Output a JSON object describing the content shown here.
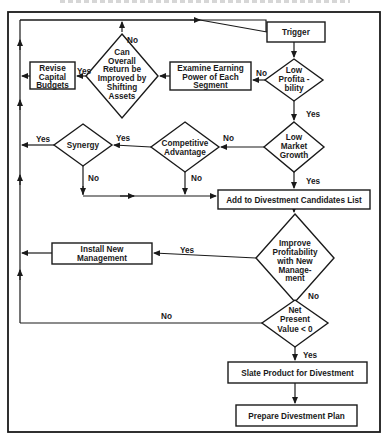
{
  "diagram": {
    "type": "flowchart",
    "nodes": {
      "trigger": {
        "kind": "process",
        "lines": [
          "Trigger"
        ]
      },
      "low_profitability": {
        "kind": "decision",
        "lines": [
          "Low",
          "Profita -",
          "bility"
        ]
      },
      "examine_earning_power": {
        "kind": "process",
        "lines": [
          "Examine Earning",
          "Power of Each",
          "Segment"
        ]
      },
      "can_overall_return": {
        "kind": "decision",
        "lines": [
          "Can",
          "Overall",
          "Return be",
          "Improved by",
          "Shifting",
          "Assets"
        ]
      },
      "revise_capital_budgets": {
        "kind": "process",
        "lines": [
          "Revise",
          "Capital",
          "Budgets"
        ]
      },
      "low_market_growth": {
        "kind": "decision",
        "lines": [
          "Low",
          "Market",
          "Growth"
        ]
      },
      "competitive_advantage": {
        "kind": "decision",
        "lines": [
          "Competitive",
          "Advantage"
        ]
      },
      "synergy": {
        "kind": "decision",
        "lines": [
          "Synergy"
        ]
      },
      "add_to_candidates": {
        "kind": "process",
        "lines": [
          "Add to Divestment Candidates List"
        ]
      },
      "improve_profitability": {
        "kind": "decision",
        "lines": [
          "Improve",
          "Profitability",
          "with New",
          "Manage-",
          "ment"
        ]
      },
      "install_new_management": {
        "kind": "process",
        "lines": [
          "Install New",
          "Management"
        ]
      },
      "net_present_value": {
        "kind": "decision",
        "lines": [
          "Net",
          "Present",
          "Value < 0"
        ]
      },
      "slate_product": {
        "kind": "process",
        "lines": [
          "Slate Product for Divestment"
        ]
      },
      "prepare_plan": {
        "kind": "process",
        "lines": [
          "Prepare Divestment Plan"
        ]
      }
    },
    "edges": [
      {
        "from": "trigger",
        "to": "low_profitability",
        "label": ""
      },
      {
        "from": "low_profitability",
        "to": "examine_earning_power",
        "label": "No"
      },
      {
        "from": "low_profitability",
        "to": "low_market_growth",
        "label": "Yes"
      },
      {
        "from": "examine_earning_power",
        "to": "can_overall_return",
        "label": ""
      },
      {
        "from": "can_overall_return",
        "to": "revise_capital_budgets",
        "label": "Yes"
      },
      {
        "from": "can_overall_return",
        "to": "trigger",
        "label": "No"
      },
      {
        "from": "revise_capital_budgets",
        "to": "trigger",
        "label": ""
      },
      {
        "from": "low_market_growth",
        "to": "competitive_advantage",
        "label": "No"
      },
      {
        "from": "low_market_growth",
        "to": "add_to_candidates",
        "label": "Yes"
      },
      {
        "from": "competitive_advantage",
        "to": "synergy",
        "label": "Yes"
      },
      {
        "from": "competitive_advantage",
        "to": "add_to_candidates",
        "label": "No"
      },
      {
        "from": "synergy",
        "to": "trigger",
        "label": "Yes"
      },
      {
        "from": "synergy",
        "to": "add_to_candidates",
        "label": "No"
      },
      {
        "from": "add_to_candidates",
        "to": "improve_profitability",
        "label": ""
      },
      {
        "from": "improve_profitability",
        "to": "install_new_management",
        "label": "Yes"
      },
      {
        "from": "improve_profitability",
        "to": "net_present_value",
        "label": "No"
      },
      {
        "from": "install_new_management",
        "to": "trigger",
        "label": ""
      },
      {
        "from": "net_present_value",
        "to": "trigger",
        "label": "No"
      },
      {
        "from": "net_present_value",
        "to": "slate_product",
        "label": "Yes"
      },
      {
        "from": "slate_product",
        "to": "prepare_plan",
        "label": ""
      }
    ],
    "edge_labels": {
      "lp_no": "No",
      "lp_yes": "Yes",
      "cor_yes": "Yes",
      "cor_no": "No",
      "lmg_no": "No",
      "lmg_yes": "Yes",
      "ca_yes": "Yes",
      "ca_no": "No",
      "syn_yes": "Yes",
      "syn_no": "No",
      "ip_yes": "Yes",
      "ip_no": "No",
      "npv_no": "No",
      "npv_yes": "Yes"
    }
  }
}
